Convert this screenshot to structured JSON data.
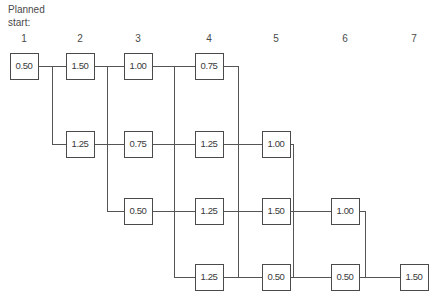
{
  "title": {
    "line1": "Planned",
    "line2": "start:",
    "text": "Planned\nstart:"
  },
  "geometry": {
    "box_width": 28,
    "box_height": 26,
    "column_x": [
      10,
      66,
      124,
      195,
      262,
      331,
      400
    ],
    "row_y": [
      53,
      131,
      198,
      264
    ],
    "elbow_x": [
      52,
      107,
      174,
      238,
      293,
      365
    ]
  },
  "columns": [
    {
      "index": 1,
      "label": "1",
      "x": 10
    },
    {
      "index": 2,
      "label": "2",
      "x": 66
    },
    {
      "index": 3,
      "label": "3",
      "x": 124
    },
    {
      "index": 4,
      "label": "4",
      "x": 195
    },
    {
      "index": 5,
      "label": "5",
      "x": 262
    },
    {
      "index": 6,
      "label": "6",
      "x": 331
    },
    {
      "index": 7,
      "label": "7",
      "x": 400
    }
  ],
  "nodes": [
    {
      "id": "n-r1c1",
      "row": 1,
      "col": 1,
      "value": "0.50"
    },
    {
      "id": "n-r1c2",
      "row": 1,
      "col": 2,
      "value": "1.50"
    },
    {
      "id": "n-r1c3",
      "row": 1,
      "col": 3,
      "value": "1.00"
    },
    {
      "id": "n-r1c4",
      "row": 1,
      "col": 4,
      "value": "0.75"
    },
    {
      "id": "n-r2c2",
      "row": 2,
      "col": 2,
      "value": "1.25"
    },
    {
      "id": "n-r2c3",
      "row": 2,
      "col": 3,
      "value": "0.75"
    },
    {
      "id": "n-r2c4",
      "row": 2,
      "col": 4,
      "value": "1.25"
    },
    {
      "id": "n-r2c5",
      "row": 2,
      "col": 5,
      "value": "1.00"
    },
    {
      "id": "n-r3c3",
      "row": 3,
      "col": 3,
      "value": "0.50"
    },
    {
      "id": "n-r3c4",
      "row": 3,
      "col": 4,
      "value": "1.25"
    },
    {
      "id": "n-r3c5",
      "row": 3,
      "col": 5,
      "value": "1.50"
    },
    {
      "id": "n-r3c6",
      "row": 3,
      "col": 6,
      "value": "1.00"
    },
    {
      "id": "n-r4c4",
      "row": 4,
      "col": 4,
      "value": "1.25"
    },
    {
      "id": "n-r4c5",
      "row": 4,
      "col": 5,
      "value": "0.50"
    },
    {
      "id": "n-r4c6",
      "row": 4,
      "col": 6,
      "value": "0.50"
    },
    {
      "id": "n-r4c7",
      "row": 4,
      "col": 7,
      "value": "1.50"
    }
  ],
  "colors": {
    "background": "#ffffff",
    "line": "#555555",
    "box_stroke": "#4a4a4a",
    "text": "#3a3a3a"
  },
  "chart_data": {
    "type": "diagram",
    "title": "Planned start:",
    "xlabel": "",
    "ylabel": "",
    "categories": [
      "1",
      "2",
      "3",
      "4",
      "5",
      "6",
      "7"
    ],
    "rows": [
      {
        "row": 1,
        "cells": [
          {
            "col": 1,
            "value": 0.5
          },
          {
            "col": 2,
            "value": 1.5
          },
          {
            "col": 3,
            "value": 1.0
          },
          {
            "col": 4,
            "value": 0.75
          },
          {
            "col": 5,
            "value": null
          },
          {
            "col": 6,
            "value": null
          },
          {
            "col": 7,
            "value": null
          }
        ]
      },
      {
        "row": 2,
        "cells": [
          {
            "col": 1,
            "value": null
          },
          {
            "col": 2,
            "value": 1.25
          },
          {
            "col": 3,
            "value": 0.75
          },
          {
            "col": 4,
            "value": 1.25
          },
          {
            "col": 5,
            "value": 1.0
          },
          {
            "col": 6,
            "value": null
          },
          {
            "col": 7,
            "value": null
          }
        ]
      },
      {
        "row": 3,
        "cells": [
          {
            "col": 1,
            "value": null
          },
          {
            "col": 2,
            "value": null
          },
          {
            "col": 3,
            "value": 0.5
          },
          {
            "col": 4,
            "value": 1.25
          },
          {
            "col": 5,
            "value": 1.5
          },
          {
            "col": 6,
            "value": 1.0
          },
          {
            "col": 7,
            "value": null
          }
        ]
      },
      {
        "row": 4,
        "cells": [
          {
            "col": 1,
            "value": null
          },
          {
            "col": 2,
            "value": null
          },
          {
            "col": 3,
            "value": null
          },
          {
            "col": 4,
            "value": 1.25
          },
          {
            "col": 5,
            "value": 0.5
          },
          {
            "col": 6,
            "value": 0.5
          },
          {
            "col": 7,
            "value": 1.5
          }
        ]
      }
    ],
    "links": [
      {
        "from": "n-r1c1",
        "to": "n-r1c2",
        "kind": "horizontal"
      },
      {
        "from": "n-r1c2",
        "to": "n-r1c3",
        "kind": "horizontal"
      },
      {
        "from": "n-r1c3",
        "to": "n-r1c4",
        "kind": "horizontal"
      },
      {
        "from": "n-r1c1",
        "to": "n-r2c2",
        "kind": "elbow-down"
      },
      {
        "from": "n-r2c2",
        "to": "n-r2c3",
        "kind": "horizontal"
      },
      {
        "from": "n-r2c3",
        "to": "n-r2c4",
        "kind": "horizontal"
      },
      {
        "from": "n-r2c4",
        "to": "n-r2c5",
        "kind": "horizontal"
      },
      {
        "from": "n-r1c2",
        "to": "n-r3c3",
        "kind": "elbow-down"
      },
      {
        "from": "n-r3c3",
        "to": "n-r3c4",
        "kind": "horizontal"
      },
      {
        "from": "n-r3c4",
        "to": "n-r3c5",
        "kind": "horizontal"
      },
      {
        "from": "n-r3c5",
        "to": "n-r3c6",
        "kind": "horizontal"
      },
      {
        "from": "n-r1c3",
        "to": "n-r4c4",
        "kind": "elbow-down"
      },
      {
        "from": "n-r4c4",
        "to": "n-r4c5",
        "kind": "horizontal"
      },
      {
        "from": "n-r4c5",
        "to": "n-r4c6",
        "kind": "horizontal"
      },
      {
        "from": "n-r4c6",
        "to": "n-r4c7",
        "kind": "horizontal"
      },
      {
        "from": "n-r1c4",
        "to": "n-r4c5",
        "kind": "elbow-down"
      },
      {
        "from": "n-r2c5",
        "to": "n-r4c6",
        "kind": "elbow-down"
      },
      {
        "from": "n-r3c6",
        "to": "n-r4c7",
        "kind": "elbow-down"
      }
    ]
  }
}
